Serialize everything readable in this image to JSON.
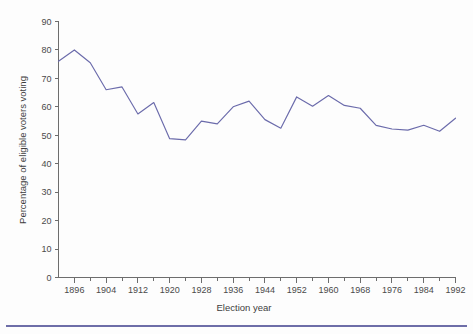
{
  "figure": {
    "background_color": "#fdfdfd",
    "line_color": "#6b6bab",
    "axis_color": "#6d6d6d",
    "text_color": "#4a4a4a",
    "footer_rule_color": "#6e6ea8"
  },
  "chart_data": {
    "type": "line",
    "title": "",
    "xlabel": "Election year",
    "ylabel": "Percentage of eligible voters voting",
    "xlim": [
      1892,
      1992
    ],
    "ylim": [
      0,
      90
    ],
    "ytick_step": 10,
    "xtick_major_step": 8,
    "xtick_minor_step": 4,
    "grid": false,
    "legend": false,
    "ytick_labels": [
      "0",
      "10",
      "20",
      "30",
      "40",
      "50",
      "60",
      "70",
      "80",
      "90"
    ],
    "ytick_values": [
      0,
      10,
      20,
      30,
      40,
      50,
      60,
      70,
      80,
      90
    ],
    "xtick_labels": [
      "1896",
      "1904",
      "1912",
      "1920",
      "1928",
      "1936",
      "1944",
      "1952",
      "1960",
      "1968",
      "1976",
      "1984",
      "1992"
    ],
    "xtick_values": [
      1896,
      1904,
      1912,
      1920,
      1928,
      1936,
      1944,
      1952,
      1960,
      1968,
      1976,
      1984,
      1992
    ],
    "xtick_minor_values": [
      1900,
      1908,
      1916,
      1924,
      1932,
      1940,
      1948,
      1956,
      1964,
      1972,
      1980,
      1988
    ],
    "series": [
      {
        "name": "Percentage of eligible voters voting",
        "color": "#6b6bab",
        "x": [
          1892,
          1896,
          1900,
          1904,
          1908,
          1912,
          1916,
          1920,
          1924,
          1928,
          1932,
          1936,
          1940,
          1944,
          1948,
          1952,
          1956,
          1960,
          1964,
          1968,
          1972,
          1976,
          1980,
          1984,
          1988,
          1992
        ],
        "values": [
          76.0,
          80.0,
          75.5,
          66.0,
          67.0,
          57.5,
          61.5,
          48.8,
          48.4,
          55.0,
          54.0,
          60.0,
          62.0,
          55.5,
          52.5,
          63.5,
          60.2,
          64.0,
          60.5,
          59.5,
          53.5,
          52.2,
          51.8,
          53.5,
          51.4,
          56.0
        ]
      }
    ]
  }
}
